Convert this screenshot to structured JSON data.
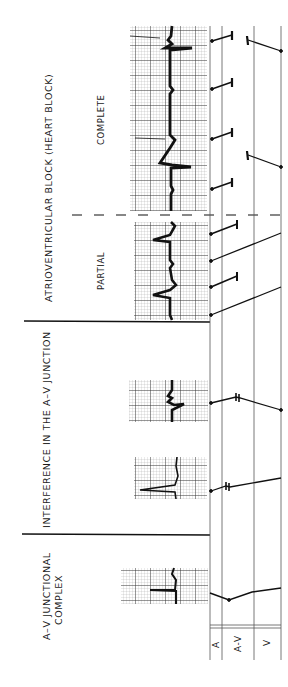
{
  "figure": {
    "orientation": "rotated-90-ccw",
    "colors": {
      "ink": "#111111",
      "grid": "#8a8a8a",
      "paper": "#ffffff"
    }
  },
  "sections": [
    {
      "id": "av-junctional-complex",
      "title_line1": "A–V  JUNCTIONAL",
      "title_line2": "COMPLEX"
    },
    {
      "id": "interference",
      "title": "INTERFERENCE  IN  THE  A–V  JUNCTION"
    },
    {
      "id": "av-block",
      "title": "ATRIOVENTRICULAR  BLOCK  (HEART  BLOCK)",
      "subsections": [
        {
          "label": "PARTIAL"
        },
        {
          "label": "COMPLETE"
        }
      ]
    }
  ],
  "ladder": {
    "lanes": [
      {
        "label": "A"
      },
      {
        "label": "A-V"
      },
      {
        "label": "V"
      }
    ]
  }
}
